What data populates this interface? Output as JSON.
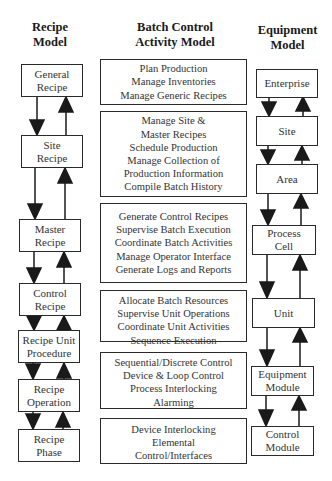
{
  "headers": {
    "recipe": [
      "Recipe",
      "Model"
    ],
    "activity": [
      "Batch Control",
      "Activity Model"
    ],
    "equipment": [
      "Equipment",
      "Model"
    ]
  },
  "recipe_model": [
    {
      "lines": [
        "General",
        "Recipe"
      ]
    },
    {
      "lines": [
        "Site",
        "Recipe"
      ]
    },
    {
      "lines": [
        "Master",
        "Recipe"
      ]
    },
    {
      "lines": [
        "Control",
        "Recipe"
      ]
    },
    {
      "lines": [
        "Recipe Unit",
        "Procedure"
      ]
    },
    {
      "lines": [
        "Recipe",
        "Operation"
      ]
    },
    {
      "lines": [
        "Recipe",
        "Phase"
      ]
    }
  ],
  "activity_model": [
    {
      "lines": [
        "Plan Production",
        "Manage Inventories",
        "Manage Generic Recipes"
      ]
    },
    {
      "lines": [
        "Manage Site &",
        "Master Recipes",
        "Schedule Production",
        "Manage Collection of",
        "Production Information",
        "Compile Batch History"
      ]
    },
    {
      "lines": [
        "Generate Control Recipes",
        "Supervise Batch Execution",
        "Coordinate Batch Activities",
        "Manage Operator Interface",
        "Generate Logs and Reports"
      ]
    },
    {
      "lines": [
        "Allocate Batch Resources",
        "Supervise Unit Operations",
        "Coordinate Unit Activities",
        "Sequence Execution"
      ]
    },
    {
      "lines": [
        "Sequential/Discrete Control",
        "Device & Loop Control",
        "Process Interlocking",
        "Alarming"
      ]
    },
    {
      "lines": [
        "Device Interlocking",
        "Elemental",
        "Control/Interfaces"
      ]
    }
  ],
  "equipment_model": [
    {
      "lines": [
        "Enterprise"
      ]
    },
    {
      "lines": [
        "Site"
      ]
    },
    {
      "lines": [
        "Area"
      ]
    },
    {
      "lines": [
        "Process",
        "Cell"
      ]
    },
    {
      "lines": [
        "Unit"
      ]
    },
    {
      "lines": [
        "Equipment",
        "Module"
      ]
    },
    {
      "lines": [
        "Control",
        "Module"
      ]
    }
  ],
  "colors": {
    "line": "#1a1a1a",
    "border": "#2a2a2a",
    "text": "#333333",
    "background": "#ffffff"
  }
}
